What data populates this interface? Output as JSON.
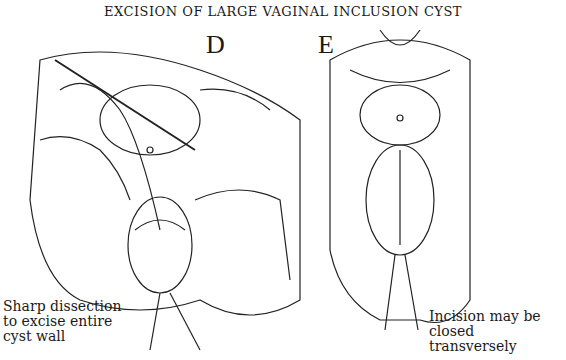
{
  "title": "EXCISION OF LARGE VAGINAL INCLUSION CYST",
  "panels": [
    {
      "label": "D",
      "caption_lines": [
        "Sharp dissection",
        "to excise entire",
        "cyst wall"
      ]
    },
    {
      "label": "E",
      "caption_lines": [
        "Incision may be",
        "closed transversely"
      ]
    }
  ]
}
